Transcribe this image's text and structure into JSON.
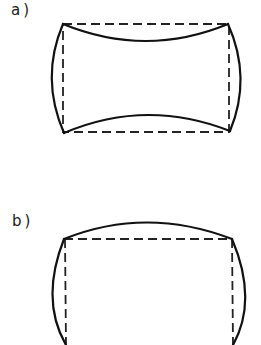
{
  "figure": {
    "panels": [
      {
        "label": "a)",
        "description": "Rectangle (dashed) with inward-curved top/bottom edges and outward-curved left/right edges (pincushion-like deformation)",
        "corners": {
          "top_left": [
            63,
            24
          ],
          "top_right": [
            228,
            24
          ],
          "bottom_right": [
            230,
            131
          ],
          "bottom_left": [
            64,
            133
          ]
        }
      },
      {
        "label": "b)",
        "description": "Rectangle (dashed) with outward-curved top and side edges (barrel-like deformation), bottom cropped",
        "corners": {
          "top_left": [
            64,
            239
          ],
          "top_right": [
            232,
            239
          ]
        }
      }
    ],
    "colors": {
      "line": "#111111",
      "background": "#ffffff"
    }
  }
}
